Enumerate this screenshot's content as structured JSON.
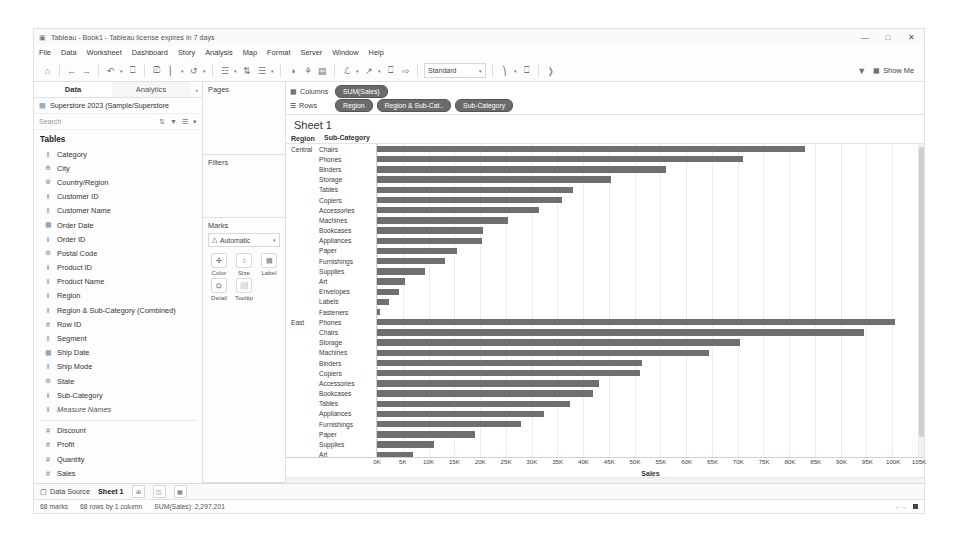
{
  "window": {
    "title": "Tableau - Book1 - Tableau license expires in 7 days",
    "app_icon": "tableau-icon",
    "minimize": "—",
    "maximize": "□",
    "close": "✕"
  },
  "menu": {
    "items": [
      "File",
      "Data",
      "Worksheet",
      "Dashboard",
      "Story",
      "Analysis",
      "Map",
      "Format",
      "Server",
      "Window",
      "Help"
    ]
  },
  "toolbar": {
    "buttons": [
      {
        "name": "home-icon",
        "glyph": "⌂"
      },
      {
        "name": "back-icon",
        "glyph": "←"
      },
      {
        "name": "forward-icon",
        "glyph": "→"
      },
      {
        "name": "save-icon",
        "glyph": "↺"
      },
      {
        "name": "undo-redo-icon",
        "glyph": "↻"
      },
      {
        "name": "new-worksheet-icon",
        "glyph": "◰"
      },
      {
        "name": "duplicate-sheet-icon",
        "glyph": "❐"
      },
      {
        "name": "clear-sheet-icon",
        "glyph": "✖"
      },
      {
        "name": "swap-rows-cols-icon",
        "glyph": "⇄"
      },
      {
        "name": "sort-ascending-icon",
        "glyph": "↑"
      },
      {
        "name": "sort-descending-icon",
        "glyph": "↓"
      },
      {
        "name": "highlight-icon",
        "glyph": "◑"
      },
      {
        "name": "group-members-icon",
        "glyph": "⊞"
      },
      {
        "name": "show-mark-labels-icon",
        "glyph": "Ⓛ"
      },
      {
        "name": "fix-axes-icon",
        "glyph": "⤢"
      },
      {
        "name": "presentation-mode-icon",
        "glyph": "▶"
      }
    ],
    "fit": {
      "label": "Standard",
      "caret": "▾"
    },
    "right_buttons": [
      {
        "name": "fit-axis-icon",
        "glyph": "⊟"
      },
      {
        "name": "presentation-icon",
        "glyph": "⬚"
      },
      {
        "name": "share-icon",
        "glyph": "☀"
      }
    ],
    "filter_icon": "funnel-icon",
    "show_me": {
      "label": "Show Me",
      "icon": "show-me-icon"
    }
  },
  "data_pane": {
    "tabs": [
      {
        "label": "Data",
        "active": true
      },
      {
        "label": "Analytics",
        "active": false
      }
    ],
    "tab_caret": "◂",
    "datasource": {
      "icon": "database-icon",
      "name": "Superstore 2023 (Sample/Superstore"
    },
    "search": {
      "placeholder": "Search",
      "tools": [
        "sort-icon",
        "filter-icon",
        "list-icon",
        "more-icon"
      ]
    },
    "group_label": "Tables",
    "dimensions": [
      {
        "label": "Category",
        "icon": "abc",
        "italic": false
      },
      {
        "label": "City",
        "icon": "globe",
        "italic": false
      },
      {
        "label": "Country/Region",
        "icon": "globe",
        "italic": false
      },
      {
        "label": "Customer ID",
        "icon": "abc",
        "italic": false
      },
      {
        "label": "Customer Name",
        "icon": "abc",
        "italic": false
      },
      {
        "label": "Order Date",
        "icon": "date",
        "italic": false
      },
      {
        "label": "Order ID",
        "icon": "abc",
        "italic": false
      },
      {
        "label": "Postal Code",
        "icon": "globe",
        "italic": false
      },
      {
        "label": "Product ID",
        "icon": "abc",
        "italic": false
      },
      {
        "label": "Product Name",
        "icon": "abc",
        "italic": false
      },
      {
        "label": "Region",
        "icon": "abc",
        "italic": false
      },
      {
        "label": "Region & Sub-Category (Combined)",
        "icon": "abc",
        "italic": false
      },
      {
        "label": "Row ID",
        "icon": "num",
        "italic": false
      },
      {
        "label": "Segment",
        "icon": "abc",
        "italic": false
      },
      {
        "label": "Ship Date",
        "icon": "date",
        "italic": false
      },
      {
        "label": "Ship Mode",
        "icon": "abc",
        "italic": false
      },
      {
        "label": "State",
        "icon": "globe",
        "italic": false
      },
      {
        "label": "Sub-Category",
        "icon": "abc",
        "italic": false
      },
      {
        "label": "Measure Names",
        "icon": "abc",
        "italic": true
      }
    ],
    "measures": [
      {
        "label": "Discount",
        "icon": "num",
        "italic": false
      },
      {
        "label": "Profit",
        "icon": "num",
        "italic": false
      },
      {
        "label": "Quantity",
        "icon": "num",
        "italic": false
      },
      {
        "label": "Sales",
        "icon": "num",
        "italic": false
      },
      {
        "label": "Latitude (generated)",
        "icon": "globe",
        "italic": true
      },
      {
        "label": "Longitude (generated)",
        "icon": "globe",
        "italic": true
      },
      {
        "label": "Superstore 2023 (Count)",
        "icon": "num",
        "italic": true
      },
      {
        "label": "Measure Values",
        "icon": "num",
        "italic": true
      }
    ]
  },
  "shelves": {
    "pages_label": "Pages",
    "filters_label": "Filters",
    "marks_label": "Marks",
    "mark_type": {
      "icon": "automatic-icon",
      "label": "Automatic",
      "caret": "▾"
    },
    "mark_buttons": [
      {
        "label": "Color",
        "icon": "color-icon",
        "glyph": "✣"
      },
      {
        "label": "Size",
        "icon": "size-icon",
        "glyph": "○"
      },
      {
        "label": "Label",
        "icon": "label-icon",
        "glyph": "▤"
      },
      {
        "label": "Detail",
        "icon": "detail-icon",
        "glyph": "⛭"
      },
      {
        "label": "Tooltip",
        "icon": "tooltip-icon",
        "glyph": "⬜"
      }
    ],
    "columns_label": "Columns",
    "rows_label": "Rows",
    "columns_pills": [
      {
        "text": "SUM(Sales)",
        "suffix": "",
        "color": "green"
      }
    ],
    "rows_pills": [
      {
        "text": "Region",
        "suffix": "",
        "color": "blue"
      },
      {
        "text": "Region & Sub-Cat..",
        "suffix": "",
        "color": "blue"
      },
      {
        "text": "Sub-Category",
        "suffix": "",
        "color": "blue"
      }
    ],
    "columns_icon": "columns-icon",
    "rows_icon": "rows-icon"
  },
  "worksheet": {
    "title": "Sheet 1",
    "header_region": "Region",
    "header_subcategory": "Sub-Category"
  },
  "chart_data": {
    "type": "bar",
    "title": "Sheet 1",
    "xlabel": "Sales",
    "ylabel": "",
    "orientation": "horizontal",
    "xlim": [
      0,
      105000
    ],
    "xticks": [
      "0K",
      "5K",
      "10K",
      "15K",
      "20K",
      "25K",
      "30K",
      "35K",
      "40K",
      "45K",
      "50K",
      "55K",
      "60K",
      "65K",
      "70K",
      "75K",
      "80K",
      "85K",
      "90K",
      "95K",
      "100K",
      "105K"
    ],
    "xtick_values": [
      0,
      5000,
      10000,
      15000,
      20000,
      25000,
      30000,
      35000,
      40000,
      45000,
      50000,
      55000,
      60000,
      65000,
      70000,
      75000,
      80000,
      85000,
      90000,
      95000,
      100000,
      105000
    ],
    "grid": true,
    "bar_color": "#6f6f6f",
    "groups": [
      {
        "region": "Central",
        "categories": [
          "Chairs",
          "Phones",
          "Binders",
          "Storage",
          "Tables",
          "Copiers",
          "Accessories",
          "Machines",
          "Bookcases",
          "Appliances",
          "Paper",
          "Furnishings",
          "Supplies",
          "Art",
          "Envelopes",
          "Labels",
          "Fasteners"
        ],
        "values": [
          83000,
          71000,
          56000,
          45500,
          38000,
          36000,
          31500,
          25500,
          20500,
          20300,
          15500,
          13200,
          9400,
          5500,
          4200,
          2400,
          500
        ]
      },
      {
        "region": "East",
        "categories": [
          "Phones",
          "Chairs",
          "Storage",
          "Machines",
          "Binders",
          "Copiers",
          "Accessories",
          "Bookcases",
          "Tables",
          "Appliances",
          "Furnishings",
          "Paper",
          "Supplies",
          "Art",
          "Envelopes"
        ],
        "values": [
          100500,
          94500,
          70500,
          64500,
          51500,
          51000,
          43000,
          42000,
          37500,
          32500,
          28000,
          19000,
          11000,
          7000,
          400
        ]
      }
    ],
    "total_label": "SUM(Sales): 2,297,201",
    "marks_count": "68 marks",
    "rows_cols": "68 rows by 1 column"
  },
  "sheet_tabs": {
    "data_source": {
      "label": "Data Source",
      "icon": "data-source-icon"
    },
    "sheets": [
      {
        "label": "Sheet 1",
        "active": true
      }
    ],
    "buttons": [
      {
        "name": "new-worksheet-button",
        "glyph": "⊞"
      },
      {
        "name": "new-dashboard-button",
        "glyph": "◫"
      },
      {
        "name": "new-story-button",
        "glyph": "▦"
      }
    ]
  },
  "statusbar": {
    "marks": "68 marks",
    "rows_cols": "68 rows by 1 column",
    "sum": "SUM(Sales): 2,297,201"
  }
}
